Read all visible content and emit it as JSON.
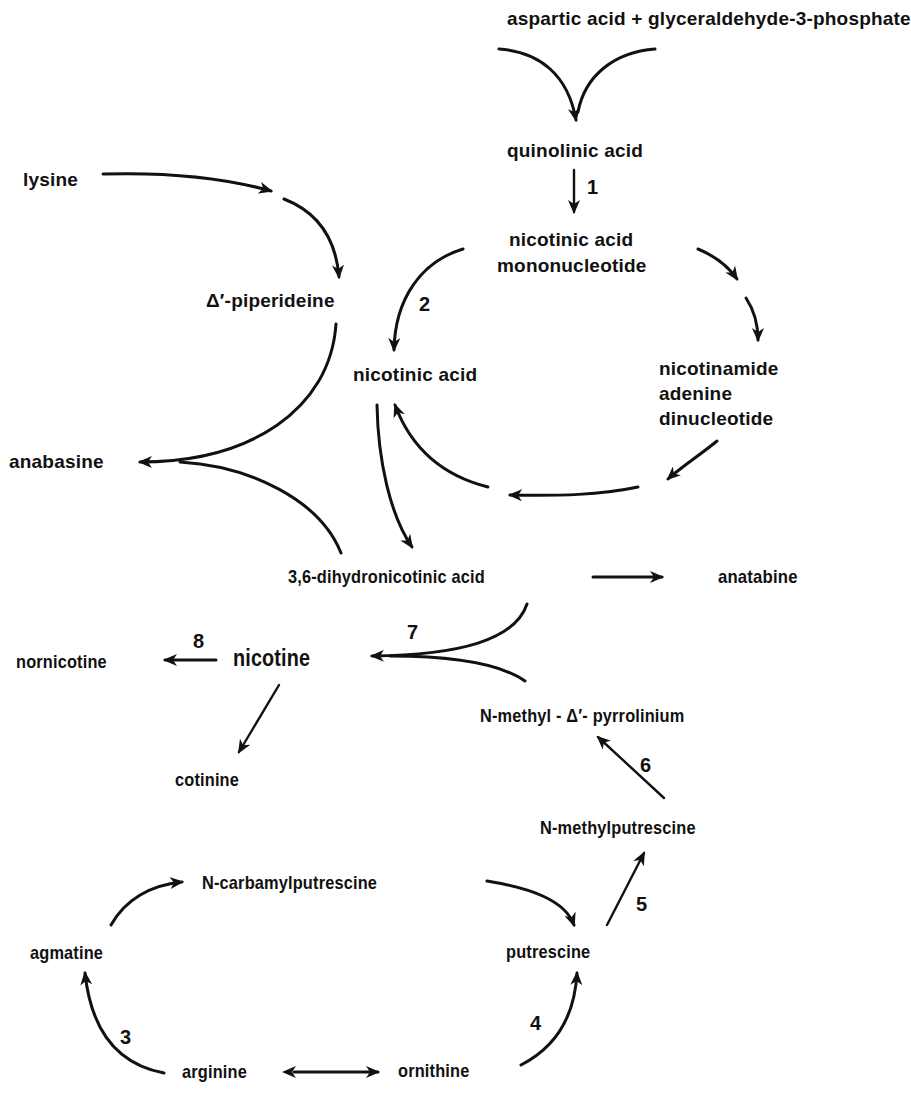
{
  "diagram": {
    "nodes": {
      "asp_g3p": "aspartic acid + glyceraldehyde-3-phosphate",
      "quinolinic": "quinolinic  acid",
      "namn_1": "nicotinic acid",
      "namn_2": "mononucleotide",
      "nad_1": "nicotinamide",
      "nad_2": "adenine",
      "nad_3": "dinucleotide",
      "nicotinic_acid": "nicotinic acid",
      "lysine": "lysine",
      "piperideine": "Δ′-piperideine",
      "anabasine": "anabasine",
      "dihydronicotinic": "3,6-dihydronicotinic acid",
      "anatabine": "anatabine",
      "nicotine": "nicotine",
      "nornicotine": "nornicotine",
      "cotinine": "cotinine",
      "pyrrolinium": "N-methyl - Δ′- pyrrolinium",
      "methylputrescine": "N-methylputrescine",
      "carbamylputrescine": "N-carbamylputrescine",
      "agmatine": "agmatine",
      "putrescine": "putrescine",
      "arginine": "arginine",
      "ornithine": "ornithine"
    },
    "steps": {
      "s1": "1",
      "s2": "2",
      "s3": "3",
      "s4": "4",
      "s5": "5",
      "s6": "6",
      "s7": "7",
      "s8": "8"
    },
    "edges": [
      {
        "from": "aspartic acid + glyceraldehyde-3-phosphate",
        "to": "quinolinic acid"
      },
      {
        "from": "quinolinic acid",
        "to": "nicotinic acid mononucleotide",
        "step": "1"
      },
      {
        "from": "nicotinic acid mononucleotide",
        "to": "nicotinic acid",
        "step": "2"
      },
      {
        "from": "nicotinic acid mononucleotide",
        "to": "nicotinamide adenine dinucleotide"
      },
      {
        "from": "nicotinamide adenine dinucleotide",
        "to": "nicotinic acid"
      },
      {
        "from": "nicotinic acid",
        "to": "3,6-dihydronicotinic acid"
      },
      {
        "from": "lysine",
        "to": "Δ′-piperideine"
      },
      {
        "from": "Δ′-piperideine",
        "to": "anabasine"
      },
      {
        "from": "3,6-dihydronicotinic acid",
        "to": "anabasine"
      },
      {
        "from": "3,6-dihydronicotinic acid",
        "to": "anatabine"
      },
      {
        "from": "3,6-dihydronicotinic acid",
        "to": "nicotine",
        "step": "7"
      },
      {
        "from": "N-methyl-Δ′-pyrrolinium",
        "to": "nicotine",
        "step": "7"
      },
      {
        "from": "nicotine",
        "to": "nornicotine",
        "step": "8"
      },
      {
        "from": "nicotine",
        "to": "cotinine"
      },
      {
        "from": "N-methylputrescine",
        "to": "N-methyl-Δ′-pyrrolinium",
        "step": "6"
      },
      {
        "from": "putrescine",
        "to": "N-methylputrescine",
        "step": "5"
      },
      {
        "from": "N-carbamylputrescine",
        "to": "putrescine"
      },
      {
        "from": "agmatine",
        "to": "N-carbamylputrescine"
      },
      {
        "from": "arginine",
        "to": "agmatine",
        "step": "3"
      },
      {
        "from": "ornithine",
        "to": "putrescine",
        "step": "4"
      },
      {
        "from": "arginine",
        "to": "ornithine",
        "bidirectional": true
      }
    ],
    "colors": {
      "ink": "#111111",
      "background": "#ffffff"
    }
  }
}
